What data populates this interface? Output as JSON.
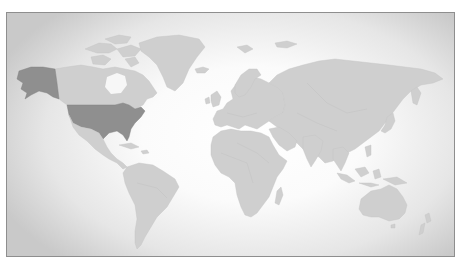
{
  "map": {
    "type": "world-choropleth",
    "style": "greyscale",
    "colors": {
      "background_center": "#ffffff",
      "background_edge": "#c9c9c9",
      "land_default": "#cfcfcf",
      "land_highlighted": "#8f8f8f",
      "frame_border": "#8e8e8e"
    },
    "highlighted_regions": [
      {
        "name": "United States",
        "id": "usa"
      },
      {
        "name": "Alaska",
        "id": "alaska"
      }
    ],
    "regions": [
      "north-america",
      "greenland",
      "south-america",
      "europe",
      "africa",
      "asia",
      "australia",
      "madagascar",
      "japan",
      "new-zealand",
      "indonesia",
      "uk-ireland",
      "iceland",
      "svalbard"
    ]
  }
}
